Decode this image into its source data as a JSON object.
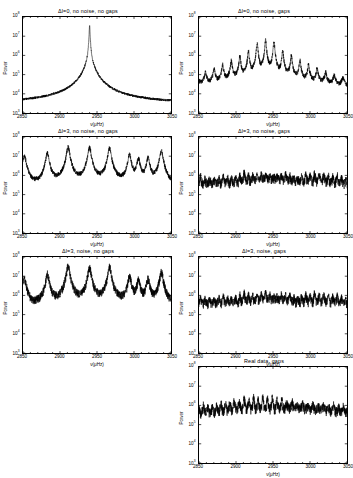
{
  "figure": {
    "axis": {
      "xlabel": "ν(μHz)",
      "ylabel": "Power",
      "xticks": [
        "2850",
        "2900",
        "2950",
        "3000",
        "3050"
      ],
      "xlim": [
        2850,
        3050
      ],
      "yticks": [
        "10",
        "10",
        "10",
        "10",
        "10",
        "10"
      ],
      "yexp": [
        "3",
        "4",
        "5",
        "6",
        "7",
        "8"
      ],
      "ylim_log": [
        3,
        8
      ],
      "minor_x_per_major": 5,
      "grid": "off",
      "tick_direction": "inward",
      "line_color": "#000000",
      "background_color": "#ffffff"
    },
    "panels": [
      {
        "id": "p1",
        "row": 1,
        "col": "left",
        "title": "Δl=0, no noise, no gaps"
      },
      {
        "id": "p2",
        "row": 1,
        "col": "right",
        "title": "Δl=0, no noise, gaps"
      },
      {
        "id": "p3",
        "row": 2,
        "col": "left",
        "title": "Δl=3, no noise, no gaps"
      },
      {
        "id": "p4",
        "row": 2,
        "col": "right",
        "title": "Δl=3, no noise, gaps"
      },
      {
        "id": "p5",
        "row": 3,
        "col": "left",
        "title": "Δl=3, noise, no gaps"
      },
      {
        "id": "p6",
        "row": 3,
        "col": "right",
        "title": "Δl=3, noise, gaps"
      },
      {
        "id": "p7",
        "row": 4,
        "col": "right",
        "title": "Real data, gaps"
      }
    ]
  },
  "chart_data": [
    {
      "id": "p1",
      "type": "line",
      "title": "Δl=0, no noise, no gaps",
      "xlabel": "ν(μHz)",
      "ylabel": "Power",
      "xlim": [
        2850,
        3050
      ],
      "ylim": [
        1000,
        100000000
      ],
      "yscale": "log",
      "grid": false,
      "legend": null,
      "description": "Single sharp Lorentzian-like peak centred near 2940 uHz reaching ~4e7, falling to a ~3e3 baseline at the plot edges; noiseless, gapless window function.",
      "peaks": [
        {
          "x": 2940,
          "y": 40000000
        }
      ],
      "baseline": 3000,
      "series": [
        {
          "name": "power",
          "x": [
            2850,
            2860,
            2870,
            2880,
            2890,
            2900,
            2910,
            2920,
            2928,
            2934,
            2938,
            2940,
            2942,
            2946,
            2952,
            2960,
            2970,
            2980,
            2990,
            3000,
            3010,
            3020,
            3030,
            3040,
            3050
          ],
          "y": [
            2700,
            2900,
            3200,
            3600,
            4200,
            5200,
            7000,
            12000,
            35000,
            180000,
            3000000,
            40000000,
            3200000,
            220000,
            42000,
            15000,
            8000,
            6000,
            5200,
            4800,
            4400,
            4100,
            3900,
            3800,
            3700
          ]
        }
      ]
    },
    {
      "id": "p2",
      "type": "line",
      "title": "Δl=0, no noise, gaps",
      "xlabel": "ν(μHz)",
      "ylabel": "Power",
      "xlim": [
        2850,
        3050
      ],
      "ylim": [
        1000,
        100000000
      ],
      "yscale": "log",
      "grid": false,
      "legend": null,
      "description": "Same single mode convolved with a gapped window function: central peak ~6e6 at 2940 uHz flanked by a regular comb of sidelobes spaced ~11.6 uHz decaying outward to a ~2e4 floor.",
      "peaks": [
        {
          "x": 2929,
          "y": 1600000
        },
        {
          "x": 2940,
          "y": 6000000
        },
        {
          "x": 2951,
          "y": 2400000
        },
        {
          "x": 2917,
          "y": 320000
        },
        {
          "x": 2963,
          "y": 300000
        },
        {
          "x": 2905,
          "y": 180000
        },
        {
          "x": 2975,
          "y": 150000
        },
        {
          "x": 2882,
          "y": 90000
        },
        {
          "x": 2998,
          "y": 70000
        },
        {
          "x": 2870,
          "y": 60000
        },
        {
          "x": 3035,
          "y": 55000
        }
      ],
      "baseline": 20000,
      "sidelobe_spacing_uHz": 11.6
    },
    {
      "id": "p3",
      "type": "line",
      "title": "Δl=3, no noise, no gaps",
      "xlabel": "ν(μHz)",
      "ylabel": "Power",
      "xlim": [
        2850,
        3050
      ],
      "ylim": [
        1000,
        100000000
      ],
      "yscale": "log",
      "grid": false,
      "legend": null,
      "description": "Multiplet of l=0..3 modes, noiseless and gapless: a series of ~10 tall narrow peaks reaching 1e7-4e7 on a ~2e5 floor, with large-separation spacing near 28 uHz and a close pair around 3000-3010 uHz.",
      "peaks": [
        {
          "x": 2852,
          "y": 6000000
        },
        {
          "x": 2883,
          "y": 15000000
        },
        {
          "x": 2911,
          "y": 30000000
        },
        {
          "x": 2940,
          "y": 28000000
        },
        {
          "x": 2967,
          "y": 26000000
        },
        {
          "x": 2994,
          "y": 12000000
        },
        {
          "x": 3006,
          "y": 7000000
        },
        {
          "x": 3019,
          "y": 8000000
        },
        {
          "x": 3037,
          "y": 20000000
        }
      ],
      "baseline": 200000,
      "large_separation_uHz": 28
    },
    {
      "id": "p4",
      "type": "line",
      "title": "Δl=3, no noise, gaps",
      "xlabel": "ν(μHz)",
      "ylabel": "Power",
      "xlim": [
        2850,
        3050
      ],
      "ylim": [
        1000,
        100000000
      ],
      "yscale": "log",
      "grid": false,
      "legend": null,
      "description": "Same multiplet through a gapped window: peaks smeared into a dense forest of sidelobes spanning ~3e5 to ~4e6 across the whole band, strongest near 2910-2970 uHz.",
      "peaks": [
        {
          "x": 2913,
          "y": 3600000
        },
        {
          "x": 2931,
          "y": 3000000
        },
        {
          "x": 2948,
          "y": 2600000
        },
        {
          "x": 2966,
          "y": 4000000
        },
        {
          "x": 2889,
          "y": 1800000
        },
        {
          "x": 3001,
          "y": 1500000
        }
      ],
      "baseline": 400000
    },
    {
      "id": "p5",
      "type": "line",
      "title": "Δl=3, noise, no gaps",
      "xlabel": "ν(μHz)",
      "ylabel": "Power",
      "xlim": [
        2850,
        3050
      ],
      "ylim": [
        1000,
        100000000
      ],
      "yscale": "log",
      "grid": false,
      "legend": null,
      "description": "Multiplet with realistic noise but no gaps: same ~10 peaks as the noiseless case, tops reaching 1e7-4e7, sitting on a noisy ~2e5 background.",
      "peaks": [
        {
          "x": 2852,
          "y": 3000000
        },
        {
          "x": 2883,
          "y": 13000000
        },
        {
          "x": 2911,
          "y": 35000000
        },
        {
          "x": 2940,
          "y": 28000000
        },
        {
          "x": 2967,
          "y": 30000000
        },
        {
          "x": 2994,
          "y": 10000000
        },
        {
          "x": 3006,
          "y": 6000000
        },
        {
          "x": 3019,
          "y": 7000000
        },
        {
          "x": 3037,
          "y": 18000000
        }
      ],
      "baseline": 250000
    },
    {
      "id": "p6",
      "type": "line",
      "title": "Δl=3, noise, gaps",
      "xlabel": "ν(μHz)",
      "ylabel": "Power",
      "xlim": [
        2850,
        3050
      ],
      "ylim": [
        1000,
        100000000
      ],
      "yscale": "log",
      "grid": false,
      "legend": null,
      "description": "Multiplet with both noise and gaps: a dense quasi-uniform forest of spikes from ~3e5 to ~4e6, with the tallest near 2913 and 2966 uHz; individual modes no longer separable.",
      "peaks": [
        {
          "x": 2913,
          "y": 3000000
        },
        {
          "x": 2966,
          "y": 3400000
        },
        {
          "x": 2931,
          "y": 2400000
        },
        {
          "x": 2948,
          "y": 2200000
        }
      ],
      "baseline": 400000
    },
    {
      "id": "p7",
      "type": "line",
      "title": "Real data, gaps",
      "xlabel": "ν(μHz)",
      "ylabel": "Power",
      "xlim": [
        2850,
        3050
      ],
      "ylim": [
        1000,
        100000000
      ],
      "yscale": "log",
      "grid": false,
      "legend": null,
      "description": "Observed solar/stellar power spectrum with gaps: spiky forest between ~3e5 and ~3e6 across 2850-3050 uHz, closely resembling the simulated noise+gaps panel.",
      "peaks": [
        {
          "x": 2936,
          "y": 3200000
        },
        {
          "x": 2911,
          "y": 2400000
        },
        {
          "x": 2962,
          "y": 2200000
        },
        {
          "x": 2893,
          "y": 1800000
        }
      ],
      "baseline": 450000
    }
  ]
}
